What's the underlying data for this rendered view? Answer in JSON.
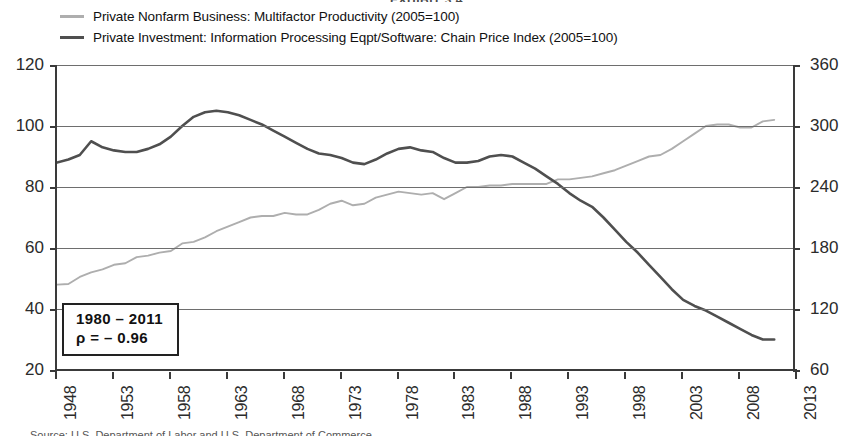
{
  "exhibit": {
    "title": "EXHIBIT 3.4"
  },
  "legend": {
    "position": "top",
    "items": [
      {
        "label": "Private Nonfarm Business: Multifactor Productivity (2005=100)",
        "color": "#aeaeae"
      },
      {
        "label": "Private Investment: Information Processing Eqpt/Software: Chain Price Index (2005=100)",
        "color": "#4f4f4f"
      }
    ]
  },
  "annotation": {
    "period": "1980 – 2011",
    "correlation": "ρ = – 0.96"
  },
  "source": {
    "note": "Source: U.S. Department of Labor and U.S. Department of Commerce"
  },
  "chart_data": {
    "type": "line",
    "title": "EXHIBIT 3.4",
    "xlabel": "",
    "ylabel": "",
    "grid": true,
    "legend_position": "top",
    "xlim": [
      1948,
      2013
    ],
    "xticks": [
      1948,
      1953,
      1958,
      1963,
      1968,
      1973,
      1978,
      1983,
      1988,
      1993,
      1998,
      2003,
      2008,
      2013
    ],
    "ylim_left": [
      20,
      120
    ],
    "yticks_left": [
      20,
      40,
      60,
      80,
      100,
      120
    ],
    "ylim_right": [
      60,
      360
    ],
    "yticks_right": [
      60,
      120,
      180,
      240,
      300,
      360
    ],
    "x": [
      1948,
      1949,
      1950,
      1951,
      1952,
      1953,
      1954,
      1955,
      1956,
      1957,
      1958,
      1959,
      1960,
      1961,
      1962,
      1963,
      1964,
      1965,
      1966,
      1967,
      1968,
      1969,
      1970,
      1971,
      1972,
      1973,
      1974,
      1975,
      1976,
      1977,
      1978,
      1979,
      1980,
      1981,
      1982,
      1983,
      1984,
      1985,
      1986,
      1987,
      1988,
      1989,
      1990,
      1991,
      1992,
      1993,
      1994,
      1995,
      1996,
      1997,
      1998,
      1999,
      2000,
      2001,
      2002,
      2003,
      2004,
      2005,
      2006,
      2007,
      2008,
      2009,
      2010,
      2011
    ],
    "series": [
      {
        "name": "Private Nonfarm Business: Multifactor Productivity (2005=100)",
        "axis": "left",
        "color": "#aeaeae",
        "values": [
          48,
          48.2,
          50.5,
          52,
          53,
          54.5,
          55,
          57,
          57.5,
          58.5,
          59,
          61.5,
          62,
          63.5,
          65.5,
          67,
          68.5,
          70,
          70.5,
          70.5,
          71.5,
          71,
          71,
          72.5,
          74.5,
          75.5,
          74,
          74.5,
          76.5,
          77.5,
          78.5,
          78,
          77.5,
          78,
          76,
          78,
          80,
          80,
          80.5,
          80.5,
          81,
          81,
          81,
          81,
          82.5,
          82.5,
          83,
          83.5,
          84.5,
          85.5,
          87,
          88.5,
          90,
          90.5,
          92.5,
          95,
          97.5,
          100,
          100.5,
          100.5,
          99.5,
          99.5,
          101.5,
          102
        ]
      },
      {
        "name": "Private Investment: Information Processing Eqpt/Software: Chain Price Index (2005=100)",
        "axis": "left",
        "color": "#4f4f4f",
        "values": [
          88,
          89,
          90.5,
          95,
          93,
          92,
          91.5,
          91.5,
          92.5,
          94,
          96.5,
          100,
          103,
          104.5,
          105,
          104.5,
          103.5,
          102,
          100.5,
          98.5,
          96.5,
          94.5,
          92.5,
          91,
          90.5,
          89.5,
          88,
          87.5,
          89,
          91,
          92.5,
          93,
          92,
          91.5,
          89.5,
          88,
          88,
          88.5,
          90,
          90.5,
          90,
          88,
          86,
          83.5,
          81,
          78,
          75.5,
          73.5,
          70,
          66,
          62,
          58.5,
          54.5,
          50.5,
          46.5,
          43,
          41,
          39.5,
          37.5,
          35.5,
          33.5,
          31.5,
          30,
          30
        ]
      }
    ],
    "annotations": [
      {
        "text": "1980 – 2011",
        "text2": "ρ = – 0.96",
        "x": 1950,
        "y": 33
      }
    ]
  }
}
